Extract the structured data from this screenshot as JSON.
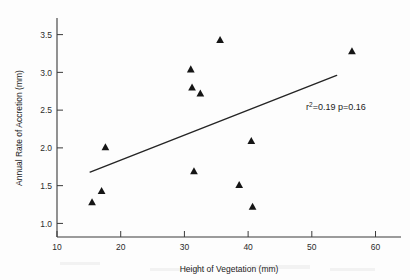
{
  "chart_data": {
    "type": "scatter",
    "title": "",
    "xlabel": "Height of Vegetation (mm)",
    "ylabel": "Annual Rate of Accretion (mm)",
    "xlim": [
      10,
      64
    ],
    "ylim": [
      0.82,
      3.72
    ],
    "xticks": [
      10,
      20,
      30,
      40,
      50,
      60
    ],
    "yticks": [
      1.0,
      1.5,
      2.0,
      2.5,
      3.0,
      3.5
    ],
    "xtick_labels": [
      "10",
      "20",
      "30",
      "40",
      "50",
      "60"
    ],
    "ytick_labels": [
      "1.0",
      "1.5",
      "2.0",
      "2.5",
      "3.0",
      "3.5"
    ],
    "grid": false,
    "legend": null,
    "marker_shape": "triangle",
    "marker_color": "#151515",
    "points": [
      {
        "x": 15.5,
        "y": 1.28
      },
      {
        "x": 17.0,
        "y": 1.43
      },
      {
        "x": 17.6,
        "y": 2.01
      },
      {
        "x": 31.0,
        "y": 3.04
      },
      {
        "x": 31.2,
        "y": 2.8
      },
      {
        "x": 32.5,
        "y": 2.72
      },
      {
        "x": 31.5,
        "y": 1.69
      },
      {
        "x": 35.6,
        "y": 3.43
      },
      {
        "x": 38.6,
        "y": 1.51
      },
      {
        "x": 40.5,
        "y": 2.09
      },
      {
        "x": 40.7,
        "y": 1.22
      },
      {
        "x": 56.3,
        "y": 3.28
      }
    ],
    "fit_line": {
      "x_start": 15.2,
      "y_start": 1.68,
      "x_end": 53.9,
      "y_end": 2.96,
      "color": "#242424"
    },
    "annotation": {
      "r_symbol": "r",
      "r_exponent": "2",
      "r_value": "=0.19",
      "p_text": " p=0.16",
      "full_text": "r2=0.19 p=0.16"
    }
  }
}
